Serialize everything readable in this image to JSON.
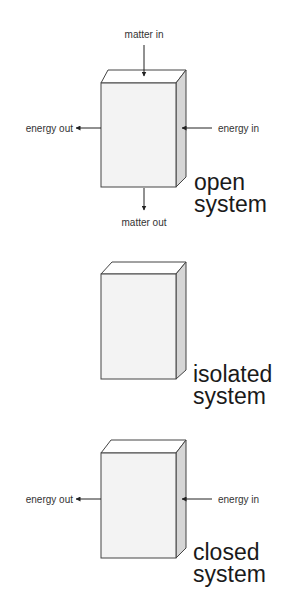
{
  "diagram": {
    "panels": [
      {
        "title_line1": "open",
        "title_line2": "system",
        "labels": {
          "matter_in": "matter in",
          "matter_out": "matter out",
          "energy_in": "energy in",
          "energy_out": "energy out"
        }
      },
      {
        "title_line1": "isolated",
        "title_line2": "system"
      },
      {
        "title_line1": "closed",
        "title_line2": "system",
        "labels": {
          "energy_in": "energy in",
          "energy_out": "energy out"
        }
      }
    ],
    "colors": {
      "front_face": "#f3f3f3",
      "top_face": "#ffffff",
      "side_face": "#d6d6d6",
      "stroke": "#444444",
      "text": "#1a1a1a"
    }
  }
}
